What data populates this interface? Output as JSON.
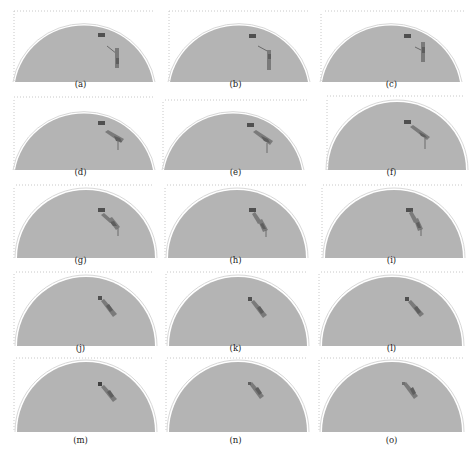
{
  "figure": {
    "background": "#ffffff",
    "dome_fill": "#b4b4b4",
    "dome_outline": "#d8d8d8",
    "frame_dots": "#c8c8c8",
    "target_color": "#505050",
    "object_color": "#7a7a7a",
    "object_dark": "#5e5e5e",
    "rows": 5,
    "cols": 3
  },
  "panels": [
    {
      "label": "(a)",
      "object": "vertical-with-arm"
    },
    {
      "label": "(b)",
      "object": "vertical-with-arm"
    },
    {
      "label": "(c)",
      "object": "vertical-with-arm"
    },
    {
      "label": "(d)",
      "object": "diagonal-with-leg"
    },
    {
      "label": "(e)",
      "object": "diagonal-with-leg"
    },
    {
      "label": "(f)",
      "object": "diagonal-with-leg"
    },
    {
      "label": "(g)",
      "object": "bent-with-leg"
    },
    {
      "label": "(h)",
      "object": "bent-with-leg"
    },
    {
      "label": "(i)",
      "object": "bent-with-leg"
    },
    {
      "label": "(j)",
      "object": "diagonal-capsule"
    },
    {
      "label": "(k)",
      "object": "diagonal-capsule"
    },
    {
      "label": "(l)",
      "object": "diagonal-capsule"
    },
    {
      "label": "(m)",
      "object": "diagonal-capsule"
    },
    {
      "label": "(n)",
      "object": "diagonal-capsule-small"
    },
    {
      "label": "(o)",
      "object": "diagonal-capsule-small"
    }
  ]
}
